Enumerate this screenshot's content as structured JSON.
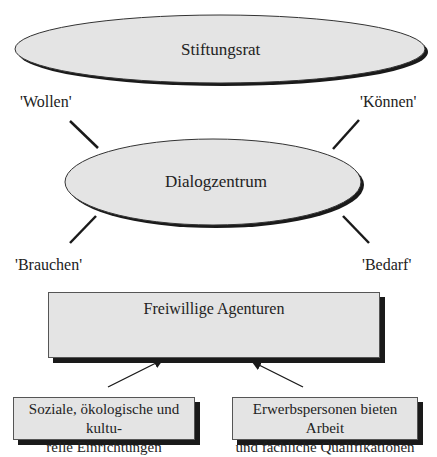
{
  "top_node": {
    "label": "Stiftungsrat"
  },
  "center_node": {
    "label": "Dialogzentrum"
  },
  "relations": {
    "top_left": "'Wollen'",
    "top_right": "'Können'",
    "bottom_left": "'Brauchen'",
    "bottom_right": "'Bedarf'"
  },
  "agency_box": {
    "label": "Freiwillige Agenturen"
  },
  "sources": [
    {
      "label_line1": "Soziale, ökologische und kultu-",
      "label_line2": "relle Einrichtungen"
    },
    {
      "label_line1": "Erwerbspersonen bieten Arbeit",
      "label_line2": "und fachliche Qualifikationen"
    }
  ],
  "colors": {
    "fill": "#e4e4e4",
    "stroke": "#1a1a1a"
  }
}
